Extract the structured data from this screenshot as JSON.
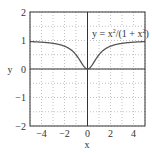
{
  "chart_data": {
    "type": "line",
    "title": "",
    "xlabel": "x",
    "ylabel": "y",
    "xlim": [
      -5,
      5
    ],
    "ylim": [
      -2,
      2
    ],
    "xticks": [
      -4,
      -2,
      0,
      2,
      4
    ],
    "yticks": [
      -2,
      -1,
      0,
      1,
      2
    ],
    "xtick_labels": [
      "−4",
      "−2",
      "0",
      "2",
      "4"
    ],
    "ytick_labels": [
      "−2",
      "−1",
      "0",
      "1",
      "2"
    ],
    "grid": true,
    "series": [
      {
        "name": "y = x²/(1 + x²)",
        "function": "x^2/(1+x^2)",
        "x": [
          -5,
          -4,
          -3,
          -2,
          -1,
          -0.5,
          0,
          0.5,
          1,
          2,
          3,
          4,
          5
        ],
        "y": [
          0.96,
          0.94,
          0.9,
          0.8,
          0.5,
          0.2,
          0,
          0.2,
          0.5,
          0.8,
          0.9,
          0.94,
          0.96
        ]
      }
    ],
    "annotations": [
      "y = x²/(1 + x²)"
    ],
    "legend_position": "inside top-right"
  },
  "labels": {
    "annotation_main": "y = x",
    "annotation_sup1": "2",
    "annotation_mid": "/(1 + x",
    "annotation_sup2": "2",
    "annotation_end": ")",
    "xlabel": "x",
    "ylabel": "y"
  }
}
